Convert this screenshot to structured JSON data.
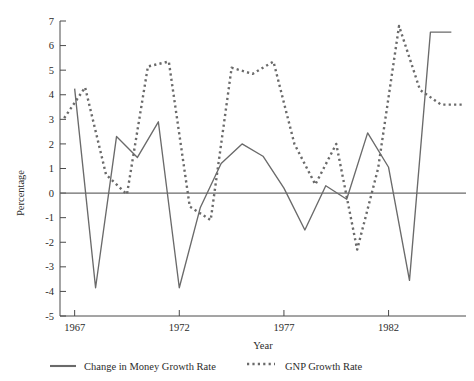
{
  "chart_data": {
    "type": "line",
    "title": "",
    "xlabel": "Year",
    "ylabel": "Percentage",
    "xlim": [
      1966.3,
      1985.7
    ],
    "ylim": [
      -5,
      7
    ],
    "xticks": [
      1967,
      1972,
      1977,
      1982
    ],
    "xtick_labels": [
      "1967",
      "1972",
      "1977",
      "1982"
    ],
    "yticks": [
      -5,
      -4,
      -3,
      -2,
      -1,
      0,
      1,
      2,
      3,
      4,
      5,
      6,
      7
    ],
    "ytick_labels": [
      "-5",
      "-4",
      "-3",
      "-2",
      "-1",
      "0",
      "1",
      "2",
      "3",
      "4",
      "5",
      "6",
      "7"
    ],
    "grid": false,
    "zero_line": true,
    "legend_position": "bottom",
    "series": [
      {
        "name": "Change in Money Growth Rate",
        "style": "solid",
        "color": "#6a6a6a",
        "x": [
          1967,
          1968,
          1969,
          1970,
          1971,
          1972,
          1973,
          1974,
          1975,
          1976,
          1977,
          1978,
          1979,
          1980,
          1981,
          1982,
          1983,
          1984,
          1985
        ],
        "values": [
          4.25,
          -3.85,
          2.3,
          1.45,
          2.9,
          -3.85,
          -0.6,
          1.2,
          2.0,
          1.5,
          0.2,
          -1.5,
          0.3,
          -0.25,
          2.45,
          1.05,
          -3.55,
          6.55,
          6.55
        ]
      },
      {
        "name": "GNP Growth Rate",
        "style": "dotted",
        "color": "#6a6a6a",
        "x": [
          1966.5,
          1967.5,
          1968.5,
          1969.5,
          1970.5,
          1971.5,
          1972.5,
          1973.5,
          1974.5,
          1975.5,
          1976.5,
          1977.5,
          1978.5,
          1979.5,
          1980.5,
          1981.5,
          1982.5,
          1983.5,
          1984.5,
          1985.5
        ],
        "values": [
          3.05,
          4.3,
          0.75,
          -0.05,
          5.15,
          5.35,
          -0.55,
          -1.1,
          5.1,
          4.85,
          5.35,
          2.0,
          0.35,
          2.0,
          -2.3,
          1.0,
          6.8,
          4.2,
          3.6,
          3.6
        ]
      }
    ]
  },
  "legend": {
    "items": [
      {
        "label": "Change in Money Growth Rate",
        "marker": "solid-line-swatch"
      },
      {
        "label": "GNP Growth Rate",
        "marker": "dotted-line-swatch"
      }
    ]
  },
  "colors": {
    "line": "#6a6a6a",
    "axis": "#4a4a4a",
    "text": "#2b2b2b",
    "background": "#ffffff"
  }
}
